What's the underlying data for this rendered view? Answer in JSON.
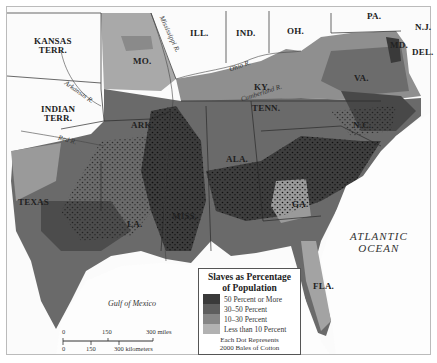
{
  "map": {
    "states": [
      {
        "name": "KANSAS\nTERR.",
        "x": 32,
        "y": 37
      },
      {
        "name": "INDIAN\nTERR.",
        "x": 42,
        "y": 105
      },
      {
        "name": "MO.",
        "x": 133,
        "y": 57
      },
      {
        "name": "ILL.",
        "x": 190,
        "y": 29
      },
      {
        "name": "IND.",
        "x": 238,
        "y": 29
      },
      {
        "name": "OH.",
        "x": 290,
        "y": 26
      },
      {
        "name": "PA.",
        "x": 370,
        "y": 11
      },
      {
        "name": "N.J.",
        "x": 418,
        "y": 22
      },
      {
        "name": "MD.",
        "x": 393,
        "y": 40
      },
      {
        "name": "DEL.",
        "x": 414,
        "y": 47
      },
      {
        "name": "VA.",
        "x": 357,
        "y": 74
      },
      {
        "name": "KY.",
        "x": 252,
        "y": 83
      },
      {
        "name": "TENN.",
        "x": 252,
        "y": 105
      },
      {
        "name": "N.C.",
        "x": 352,
        "y": 121
      },
      {
        "name": "ARK.",
        "x": 131,
        "y": 121
      },
      {
        "name": "ALA.",
        "x": 228,
        "y": 155
      },
      {
        "name": "TEXAS",
        "x": 18,
        "y": 198
      },
      {
        "name": "LA.",
        "x": 128,
        "y": 220
      },
      {
        "name": "MISS.",
        "x": 173,
        "y": 212
      },
      {
        "name": "GA.",
        "x": 292,
        "y": 200
      },
      {
        "name": "FLA.",
        "x": 313,
        "y": 282
      }
    ],
    "rivers": [
      {
        "name": "Mississippi R.",
        "x": 162,
        "y": 22,
        "rot": 65
      },
      {
        "name": "Ohio R.",
        "x": 229,
        "y": 62,
        "rot": -20
      },
      {
        "name": "Cumberland R.",
        "x": 239,
        "y": 90,
        "rot": -18
      },
      {
        "name": "Tennessee R.",
        "x": 290,
        "y": 96,
        "rot": -25
      },
      {
        "name": "Arkansas R.",
        "x": 68,
        "y": 90,
        "rot": 35
      },
      {
        "name": "Red R.",
        "x": 58,
        "y": 136,
        "rot": 15
      }
    ],
    "water": {
      "ocean_line1": "ATLANTIC",
      "ocean_line2": "OCEAN",
      "gulf": "Gulf of Mexico"
    }
  },
  "legend": {
    "title_line1": "Slaves as Percentage",
    "title_line2": "of Population",
    "items": [
      {
        "label": "50 Percent or More",
        "color": "#3a3a3a"
      },
      {
        "label": "30–50 Percent",
        "color": "#5e5e5e"
      },
      {
        "label": "10–30 Percent",
        "color": "#868686"
      },
      {
        "label": "Less than 10 Percent",
        "color": "#b2b2b2"
      }
    ],
    "note_line1": "Each Dot Represents",
    "note_line2": "2000 Bales of Cotton"
  },
  "scale": {
    "miles": [
      "0",
      "150",
      "300 miles"
    ],
    "km": [
      "0",
      "150",
      "300 kilometers"
    ]
  }
}
